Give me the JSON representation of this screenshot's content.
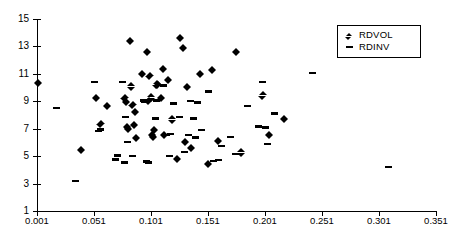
{
  "chart_data": {
    "type": "scatter",
    "title": "",
    "xlabel": "",
    "ylabel": "",
    "xlim": [
      0.001,
      0.351
    ],
    "ylim": [
      1,
      15
    ],
    "grid": false,
    "legend_position": "top-right",
    "x_ticks": [
      "0.001",
      "0.051",
      "0.101",
      "0.151",
      "0.201",
      "0.251",
      "0.301",
      "0.351"
    ],
    "x_tick_values": [
      0.001,
      0.051,
      0.101,
      0.151,
      0.201,
      0.251,
      0.301,
      0.351
    ],
    "y_ticks": [
      "1",
      "3",
      "5",
      "7",
      "9",
      "11",
      "13",
      "15"
    ],
    "y_tick_values": [
      1,
      3,
      5,
      7,
      9,
      11,
      13,
      15
    ],
    "series": [
      {
        "name": "RDVOL",
        "marker": "diamond",
        "color": "#000000",
        "points": [
          [
            0.002,
            10.3
          ],
          [
            0.04,
            5.4
          ],
          [
            0.053,
            9.2
          ],
          [
            0.057,
            7.35
          ],
          [
            0.063,
            8.65
          ],
          [
            0.078,
            9.2
          ],
          [
            0.079,
            8.95
          ],
          [
            0.08,
            7.1
          ],
          [
            0.081,
            6.95
          ],
          [
            0.083,
            13.4
          ],
          [
            0.084,
            10.05
          ],
          [
            0.085,
            8.7
          ],
          [
            0.086,
            7.25
          ],
          [
            0.087,
            8.2
          ],
          [
            0.088,
            6.3
          ],
          [
            0.093,
            10.95
          ],
          [
            0.098,
            12.6
          ],
          [
            0.099,
            9.0
          ],
          [
            0.1,
            10.8
          ],
          [
            0.101,
            9.25
          ],
          [
            0.102,
            6.5
          ],
          [
            0.103,
            6.35
          ],
          [
            0.104,
            6.9
          ],
          [
            0.106,
            10.2
          ],
          [
            0.107,
            10.15
          ],
          [
            0.11,
            9.2
          ],
          [
            0.112,
            11.35
          ],
          [
            0.113,
            6.5
          ],
          [
            0.116,
            10.55
          ],
          [
            0.12,
            7.65
          ],
          [
            0.124,
            4.75
          ],
          [
            0.127,
            13.6
          ],
          [
            0.129,
            12.85
          ],
          [
            0.131,
            6.0
          ],
          [
            0.133,
            10.0
          ],
          [
            0.136,
            5.6
          ],
          [
            0.144,
            10.95
          ],
          [
            0.151,
            4.4
          ],
          [
            0.155,
            11.25
          ],
          [
            0.16,
            6.1
          ],
          [
            0.176,
            12.6
          ],
          [
            0.18,
            5.25
          ],
          [
            0.199,
            9.4
          ],
          [
            0.205,
            6.5
          ],
          [
            0.218,
            7.7
          ]
        ]
      },
      {
        "name": "RDINV",
        "marker": "dash",
        "color": "#000000",
        "points": [
          [
            0.018,
            8.5
          ],
          [
            0.035,
            3.2
          ],
          [
            0.051,
            10.4
          ],
          [
            0.055,
            6.85
          ],
          [
            0.057,
            6.95
          ],
          [
            0.07,
            4.75
          ],
          [
            0.072,
            5.05
          ],
          [
            0.076,
            10.4
          ],
          [
            0.078,
            4.55
          ],
          [
            0.079,
            7.85
          ],
          [
            0.08,
            6.05
          ],
          [
            0.085,
            5.0
          ],
          [
            0.094,
            9.05
          ],
          [
            0.095,
            8.95
          ],
          [
            0.097,
            4.6
          ],
          [
            0.099,
            4.55
          ],
          [
            0.105,
            7.75
          ],
          [
            0.106,
            9.05
          ],
          [
            0.112,
            10.15
          ],
          [
            0.115,
            6.55
          ],
          [
            0.117,
            5.0
          ],
          [
            0.118,
            6.6
          ],
          [
            0.121,
            8.85
          ],
          [
            0.126,
            7.85
          ],
          [
            0.13,
            5.3
          ],
          [
            0.134,
            6.55
          ],
          [
            0.136,
            9.0
          ],
          [
            0.138,
            7.75
          ],
          [
            0.14,
            6.35
          ],
          [
            0.142,
            8.9
          ],
          [
            0.145,
            6.9
          ],
          [
            0.151,
            9.7
          ],
          [
            0.156,
            4.65
          ],
          [
            0.16,
            4.7
          ],
          [
            0.163,
            5.75
          ],
          [
            0.171,
            6.4
          ],
          [
            0.175,
            5.15
          ],
          [
            0.186,
            8.65
          ],
          [
            0.195,
            7.15
          ],
          [
            0.199,
            10.4
          ],
          [
            0.201,
            7.1
          ],
          [
            0.203,
            5.9
          ],
          [
            0.209,
            8.1
          ],
          [
            0.243,
            11.05
          ],
          [
            0.309,
            4.2
          ]
        ]
      }
    ]
  },
  "legend": {
    "entries": [
      {
        "label": "RDVOL",
        "marker": "diamond-marker-icon"
      },
      {
        "label": "RDINV",
        "marker": "dash-marker-icon"
      }
    ]
  }
}
